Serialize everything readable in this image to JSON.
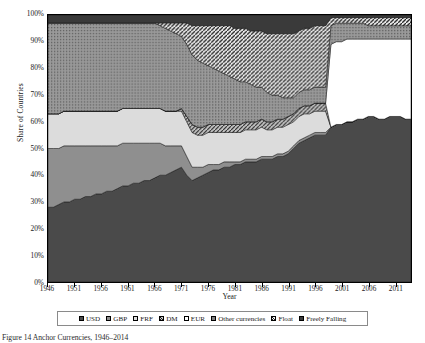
{
  "axes": {
    "ylabel": "Share of Countries",
    "xlabel": "Year",
    "yticks": [
      "0%",
      "10%",
      "20%",
      "30%",
      "40%",
      "50%",
      "60%",
      "70%",
      "80%",
      "90%",
      "100%"
    ],
    "xticks": [
      "1946",
      "1951",
      "1956",
      "1961",
      "1966",
      "1971",
      "1976",
      "1981",
      "1986",
      "1991",
      "1996",
      "2001",
      "2006",
      "2011"
    ]
  },
  "caption": "Figure 14 Anchor Currencies, 1946–2014",
  "legend": [
    {
      "label": "USD",
      "fill": "#4a4a4a",
      "pattern": "solid"
    },
    {
      "label": "GBP",
      "fill": "#8f8f8f",
      "pattern": "solid"
    },
    {
      "label": "FRF",
      "fill": "#dcdcdc",
      "pattern": "solid"
    },
    {
      "label": "DM",
      "fill": "#b8b8b8",
      "pattern": "hatch"
    },
    {
      "label": "EUR",
      "fill": "#ffffff",
      "pattern": "solid"
    },
    {
      "label": "Other currencies",
      "fill": "#9a9a9a",
      "pattern": "dots"
    },
    {
      "label": "Float",
      "fill": "#c8c8c8",
      "pattern": "stripe"
    },
    {
      "label": "Freely Falling",
      "fill": "#3a3a3a",
      "pattern": "solid"
    }
  ],
  "chart_data": {
    "type": "area",
    "title": "Anchor Currencies, 1946–2014",
    "xlabel": "Year",
    "ylabel": "Share of Countries",
    "ylim": [
      0,
      100
    ],
    "xlim": [
      1946,
      2014
    ],
    "stacked": true,
    "normalized_percent": true,
    "grid": false,
    "legend_position": "bottom",
    "x": [
      1946,
      1947,
      1948,
      1949,
      1950,
      1951,
      1952,
      1953,
      1954,
      1955,
      1956,
      1957,
      1958,
      1959,
      1960,
      1961,
      1962,
      1963,
      1964,
      1965,
      1966,
      1967,
      1968,
      1969,
      1970,
      1971,
      1972,
      1973,
      1974,
      1975,
      1976,
      1977,
      1978,
      1979,
      1980,
      1981,
      1982,
      1983,
      1984,
      1985,
      1986,
      1987,
      1988,
      1989,
      1990,
      1991,
      1992,
      1993,
      1994,
      1995,
      1996,
      1997,
      1998,
      1999,
      2000,
      2001,
      2002,
      2003,
      2004,
      2005,
      2006,
      2007,
      2008,
      2009,
      2010,
      2011,
      2012,
      2013,
      2014
    ],
    "series": [
      {
        "name": "USD",
        "values": [
          28,
          28,
          29,
          30,
          30,
          31,
          31,
          32,
          32,
          33,
          33,
          34,
          34,
          35,
          36,
          36,
          37,
          37,
          38,
          38,
          39,
          40,
          40,
          41,
          42,
          43,
          40,
          38,
          39,
          40,
          41,
          42,
          42,
          43,
          43,
          44,
          44,
          45,
          45,
          45,
          46,
          46,
          46,
          47,
          47,
          48,
          50,
          52,
          53,
          54,
          55,
          55,
          55,
          58,
          59,
          59,
          60,
          60,
          61,
          61,
          62,
          62,
          61,
          61,
          62,
          62,
          62,
          61,
          61
        ]
      },
      {
        "name": "GBP",
        "values": [
          22,
          22,
          21,
          21,
          21,
          20,
          20,
          19,
          19,
          18,
          18,
          17,
          17,
          16,
          16,
          16,
          15,
          15,
          14,
          14,
          13,
          12,
          11,
          10,
          9,
          8,
          7,
          5,
          4,
          3,
          3,
          2,
          2,
          2,
          2,
          1,
          1,
          1,
          1,
          1,
          1,
          1,
          1,
          1,
          1,
          1,
          1,
          1,
          1,
          1,
          1,
          1,
          1,
          0,
          0,
          0,
          0,
          0,
          0,
          0,
          0,
          0,
          0,
          0,
          0,
          0,
          0,
          0,
          0
        ]
      },
      {
        "name": "FRF",
        "values": [
          13,
          13,
          13,
          13,
          13,
          13,
          13,
          13,
          13,
          13,
          13,
          13,
          13,
          13,
          13,
          13,
          13,
          13,
          13,
          13,
          13,
          13,
          13,
          13,
          13,
          13,
          13,
          13,
          12,
          12,
          12,
          12,
          12,
          11,
          11,
          11,
          11,
          11,
          11,
          11,
          11,
          10,
          10,
          10,
          10,
          10,
          9,
          9,
          9,
          8,
          8,
          8,
          8,
          0,
          0,
          0,
          0,
          0,
          0,
          0,
          0,
          0,
          0,
          0,
          0,
          0,
          0,
          0,
          0
        ]
      },
      {
        "name": "DM",
        "values": [
          0,
          0,
          0,
          0,
          0,
          0,
          0,
          0,
          0,
          0,
          0,
          0,
          0,
          0,
          0,
          0,
          0,
          0,
          0,
          0,
          0,
          0,
          0,
          0,
          0,
          1,
          2,
          3,
          3,
          3,
          3,
          3,
          3,
          3,
          3,
          3,
          3,
          3,
          3,
          3,
          3,
          3,
          3,
          3,
          3,
          3,
          3,
          3,
          3,
          3,
          3,
          3,
          3,
          0,
          0,
          0,
          0,
          0,
          0,
          0,
          0,
          0,
          0,
          0,
          0,
          0,
          0,
          0,
          0
        ]
      },
      {
        "name": "EUR",
        "values": [
          0,
          0,
          0,
          0,
          0,
          0,
          0,
          0,
          0,
          0,
          0,
          0,
          0,
          0,
          0,
          0,
          0,
          0,
          0,
          0,
          0,
          0,
          0,
          0,
          0,
          0,
          0,
          0,
          0,
          0,
          0,
          0,
          0,
          0,
          0,
          0,
          0,
          0,
          0,
          0,
          0,
          0,
          0,
          0,
          0,
          0,
          0,
          0,
          0,
          0,
          0,
          0,
          0,
          31,
          31,
          31,
          31,
          31,
          30,
          30,
          29,
          29,
          30,
          30,
          29,
          29,
          29,
          30,
          30
        ]
      },
      {
        "name": "Other currencies",
        "values": [
          34,
          34,
          34,
          33,
          33,
          33,
          33,
          33,
          33,
          33,
          33,
          33,
          33,
          33,
          32,
          32,
          32,
          32,
          32,
          32,
          32,
          31,
          31,
          30,
          29,
          27,
          27,
          26,
          25,
          24,
          22,
          21,
          20,
          19,
          18,
          17,
          16,
          15,
          14,
          13,
          12,
          11,
          10,
          9,
          8,
          7,
          6,
          6,
          6,
          6,
          6,
          6,
          6,
          7,
          7,
          7,
          6,
          6,
          6,
          6,
          5,
          5,
          5,
          5,
          5,
          5,
          5,
          5,
          5
        ]
      },
      {
        "name": "Float",
        "values": [
          0,
          0,
          0,
          0,
          0,
          0,
          0,
          0,
          0,
          0,
          0,
          0,
          0,
          0,
          0,
          0,
          0,
          0,
          0,
          0,
          0,
          1,
          2,
          3,
          4,
          5,
          8,
          11,
          13,
          14,
          15,
          16,
          17,
          18,
          19,
          19,
          20,
          20,
          20,
          21,
          21,
          22,
          23,
          23,
          24,
          24,
          24,
          23,
          23,
          23,
          23,
          23,
          23,
          3,
          2,
          2,
          2,
          2,
          2,
          2,
          3,
          3,
          3,
          3,
          3,
          3,
          3,
          3,
          3
        ]
      },
      {
        "name": "Freely Falling",
        "values": [
          3,
          3,
          3,
          3,
          3,
          3,
          3,
          3,
          3,
          3,
          3,
          3,
          3,
          3,
          3,
          3,
          3,
          3,
          3,
          3,
          3,
          3,
          3,
          3,
          3,
          3,
          3,
          4,
          4,
          4,
          4,
          4,
          4,
          4,
          4,
          5,
          5,
          5,
          6,
          6,
          6,
          7,
          7,
          7,
          7,
          7,
          7,
          6,
          5,
          5,
          4,
          4,
          4,
          1,
          1,
          1,
          1,
          1,
          1,
          1,
          1,
          1,
          1,
          1,
          1,
          1,
          1,
          1,
          1
        ]
      }
    ]
  }
}
